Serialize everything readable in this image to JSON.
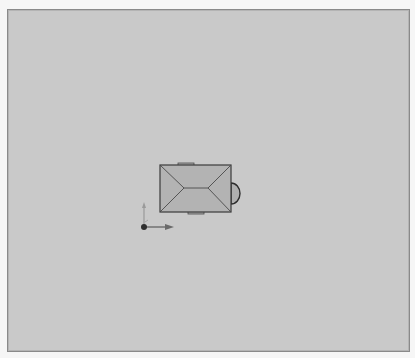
{
  "viewport": {
    "view": "top",
    "background_color": "#c9c9c9",
    "border_color": "#8a8a8a"
  },
  "model": {
    "type": "building-hip-roof",
    "fill_color": "#b3b3b3",
    "outline_color": "#3a3a3a",
    "tab_color": "#a9a9a9"
  },
  "gizmo": {
    "x_axis_color": "#6a6a6a",
    "y_axis_color": "#9a9a9a",
    "origin_color": "#2e2e2e"
  }
}
